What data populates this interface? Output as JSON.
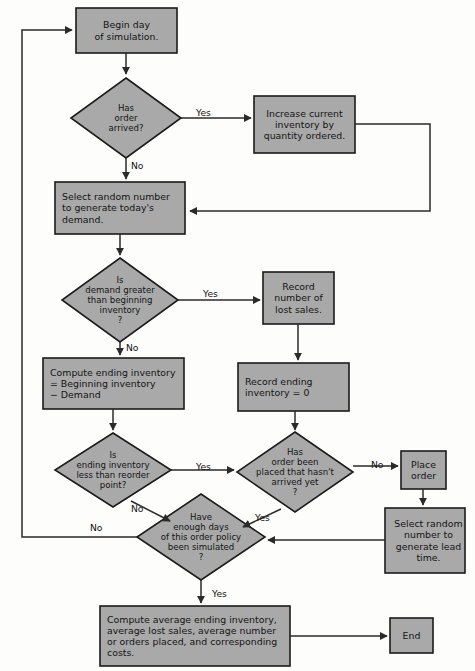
{
  "diagram": {
    "style": {
      "node_fill": "#a9a9a9",
      "node_stroke": "#1b1b1b",
      "line_color": "#2a2a2a",
      "page_background": "#fdfdfc",
      "text_color": "#141414"
    },
    "nodes": [
      {
        "id": "begin-day",
        "type": "process",
        "label": "Begin day\nof simulation.",
        "x": 76,
        "y": 8,
        "w": 101,
        "h": 45
      },
      {
        "id": "has-order-arrived",
        "type": "decision",
        "label": "Has\norder\narrived?",
        "cx": 126,
        "cy": 118,
        "rx": 55,
        "ry": 40
      },
      {
        "id": "increase-inventory",
        "type": "process",
        "label": "Increase current\ninventory by\nquantity ordered.",
        "x": 254,
        "y": 96,
        "w": 101,
        "h": 57
      },
      {
        "id": "select-random-demand",
        "type": "process",
        "label": "Select random number\nto generate today's\ndemand.",
        "x": 55,
        "y": 182,
        "w": 130,
        "h": 52
      },
      {
        "id": "demand-greater",
        "type": "decision",
        "label": "Is\ndemand greater\nthan beginning\ninventory\n?",
        "cx": 120,
        "cy": 300,
        "rx": 58,
        "ry": 42
      },
      {
        "id": "record-lost-sales",
        "type": "process",
        "label": "Record\nnumber of\nlost sales.",
        "x": 263,
        "y": 272,
        "w": 71,
        "h": 52
      },
      {
        "id": "compute-ending-inventory",
        "type": "process",
        "label": "Compute ending inventory\n= Beginning inventory\n− Demand",
        "x": 43,
        "y": 358,
        "w": 141,
        "h": 51
      },
      {
        "id": "record-ending-zero",
        "type": "process",
        "label": "Record ending\ninventory = 0",
        "x": 238,
        "y": 363,
        "w": 111,
        "h": 48
      },
      {
        "id": "ending-less-reorder",
        "type": "decision",
        "label": "Is\nending inventory\nless than reorder\npoint?",
        "cx": 113,
        "cy": 470,
        "rx": 58,
        "ry": 37
      },
      {
        "id": "order-placed-not-arrived",
        "type": "decision",
        "label": "Has\norder been\nplaced that hasn't\narrived yet\n?",
        "cx": 295,
        "cy": 472,
        "rx": 58,
        "ry": 40
      },
      {
        "id": "place-order",
        "type": "process",
        "label": "Place\norder",
        "x": 401,
        "y": 451,
        "w": 45,
        "h": 38
      },
      {
        "id": "select-random-lead",
        "type": "process",
        "label": "Select random\nnumber to\ngenerate lead\ntime.",
        "x": 385,
        "y": 508,
        "w": 80,
        "h": 65
      },
      {
        "id": "enough-days",
        "type": "decision",
        "label": "Have\nenough days\nof this order policy\nbeen simulated\n?",
        "cx": 201,
        "cy": 537,
        "rx": 64,
        "ry": 43
      },
      {
        "id": "compute-averages",
        "type": "process",
        "label": "Compute average ending inventory,\naverage lost sales, average number\nor orders placed, and corresponding\ncosts.",
        "x": 100,
        "y": 606,
        "w": 190,
        "h": 60
      },
      {
        "id": "end",
        "type": "process",
        "label": "End",
        "x": 390,
        "y": 618,
        "w": 43,
        "h": 35
      }
    ],
    "edge_labels": [
      {
        "id": "arrived-yes",
        "text": "Yes",
        "x": 196,
        "y": 107
      },
      {
        "id": "arrived-no",
        "text": "No",
        "x": 131,
        "y": 160
      },
      {
        "id": "demand-yes",
        "text": "Yes",
        "x": 203,
        "y": 288
      },
      {
        "id": "demand-no",
        "text": "No",
        "x": 126,
        "y": 342
      },
      {
        "id": "reorder-yes",
        "text": "Yes",
        "x": 196,
        "y": 461
      },
      {
        "id": "reorder-no",
        "text": "No",
        "x": 131,
        "y": 503
      },
      {
        "id": "placed-no",
        "text": "No",
        "x": 371,
        "y": 459
      },
      {
        "id": "placed-yes",
        "text": "Yes",
        "x": 255,
        "y": 512
      },
      {
        "id": "loopback-no",
        "text": "No",
        "x": 90,
        "y": 522
      },
      {
        "id": "enough-yes",
        "text": "Yes",
        "x": 212,
        "y": 588
      }
    ]
  }
}
